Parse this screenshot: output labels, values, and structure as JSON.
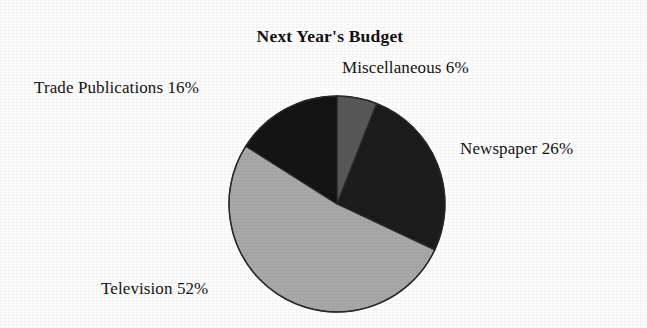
{
  "chart_data": {
    "type": "pie",
    "title": "Next Year's Budget",
    "xlabel": "",
    "ylabel": "",
    "legend_position": "none",
    "grid": false,
    "start_angle_deg": 0,
    "direction": "clockwise",
    "categories": [
      "Miscellaneous",
      "Newspaper",
      "Television",
      "Trade Publications"
    ],
    "values": [
      6,
      26,
      52,
      16
    ],
    "unit": "%",
    "labels": [
      "Miscellaneous 6%",
      "Newspaper 26%",
      "Television 52%",
      "Trade Publications 16%"
    ],
    "slices": [
      {
        "name": "Miscellaneous",
        "value": 6,
        "label": "Miscellaneous 6%",
        "color": "#585858",
        "start_deg": 0,
        "end_deg": 21.6
      },
      {
        "name": "Newspaper",
        "value": 26,
        "label": "Newspaper 26%",
        "color": "#1c1c1c",
        "start_deg": 21.6,
        "end_deg": 115.2
      },
      {
        "name": "Television",
        "value": 52,
        "label": "Television 52%",
        "color": "#a8a8a8",
        "start_deg": 115.2,
        "end_deg": 302.4
      },
      {
        "name": "Trade Publications",
        "value": 16,
        "label": "Trade Publications 16%",
        "color": "#141414",
        "start_deg": 302.4,
        "end_deg": 360
      }
    ]
  },
  "figure": {
    "title": "Next Year's Budget",
    "background_color": "#fdfdfd",
    "outline_color": "#2a2a2a"
  },
  "labels": {
    "trade_publications": "Trade Publications 16%",
    "miscellaneous": "Miscellaneous 6%",
    "newspaper": "Newspaper 26%",
    "television": "Television 52%"
  }
}
